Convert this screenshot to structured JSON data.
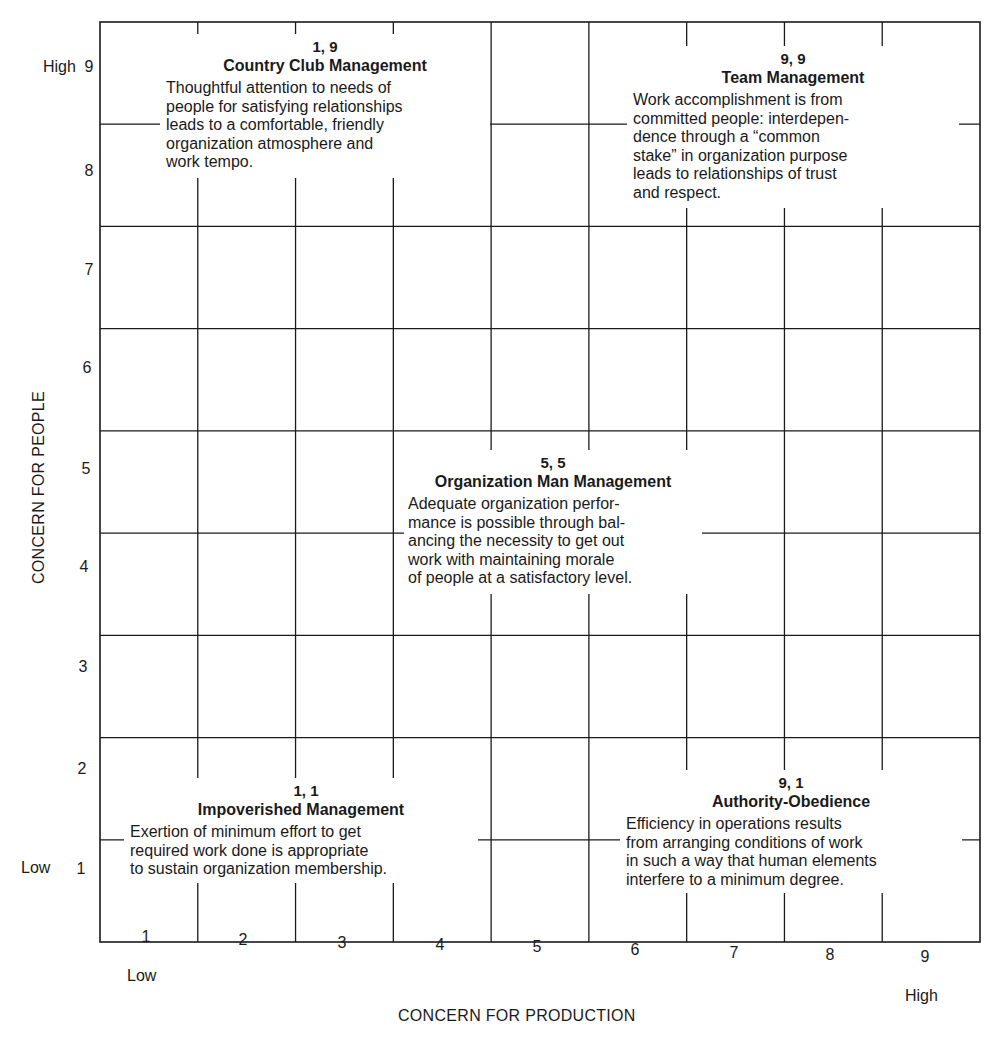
{
  "chart_data": {
    "type": "grid",
    "xlabel": "CONCERN FOR PRODUCTION",
    "ylabel": "CONCERN FOR PEOPLE",
    "x_ticks": [
      "1",
      "2",
      "3",
      "4",
      "5",
      "6",
      "7",
      "8",
      "9"
    ],
    "y_ticks": [
      "1",
      "2",
      "3",
      "4",
      "5",
      "6",
      "7",
      "8",
      "9"
    ],
    "x_low_label": "Low",
    "x_high_label": "High",
    "y_low_label": "Low",
    "y_high_label": "High",
    "xlim": [
      0.5,
      9.5
    ],
    "ylim": [
      0.5,
      9.5
    ],
    "grid": true,
    "styles": [
      {
        "x": 1,
        "y": 9,
        "coord": "1, 9",
        "name": "Country Club Management",
        "description": "Thoughtful attention to needs of\npeople for satisfying relationships\nleads to a comfortable, friendly\norganization atmosphere and\nwork tempo."
      },
      {
        "x": 9,
        "y": 9,
        "coord": "9, 9",
        "name": "Team Management",
        "description": "Work accomplishment is from\ncommitted people: interdepen-\ndence through a “common\nstake” in organization purpose\nleads to relationships of trust\nand respect."
      },
      {
        "x": 5,
        "y": 5,
        "coord": "5, 5",
        "name": "Organization Man Management",
        "description": "Adequate organization perfor-\nmance is possible through bal-\nancing the necessity to get out\nwork with maintaining morale\nof people at a satisfactory level."
      },
      {
        "x": 1,
        "y": 1,
        "coord": "1, 1",
        "name": "Impoverished Management",
        "description": "Exertion of minimum effort to get\nrequired work done is appropriate\nto sustain organization membership."
      },
      {
        "x": 9,
        "y": 1,
        "coord": "9, 1",
        "name": "Authority-Obedience",
        "description": "Efficiency in operations results\nfrom arranging conditions of work\nin such a way that human elements\ninterfere to a minimum degree."
      }
    ]
  }
}
